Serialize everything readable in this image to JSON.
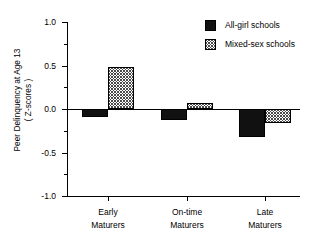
{
  "chart_data": {
    "type": "bar",
    "title": "",
    "xlabel": "",
    "ylabel": "Peer Delinquency at Age 13",
    "ylabel_line2": "( Z-scores )",
    "categories": [
      "Early\nMaturers",
      "On-time\nMaturers",
      "Late\nMaturers"
    ],
    "category_labels": [
      {
        "line1": "Early",
        "line2": "Maturers"
      },
      {
        "line1": "On-time",
        "line2": "Maturers"
      },
      {
        "line1": "Late",
        "line2": "Maturers"
      }
    ],
    "series": [
      {
        "name": "All-girl schools",
        "fill": "solid-black",
        "color": "#111111",
        "values": [
          -0.09,
          -0.13,
          -0.32
        ]
      },
      {
        "name": "Mixed-sex schools",
        "fill": "crosshatch-gray",
        "color": "#4a4a4a",
        "values": [
          0.48,
          0.07,
          -0.16
        ]
      }
    ],
    "ylim": [
      -1.0,
      1.0
    ],
    "ytick_values": [
      1.0,
      0.5,
      0.0,
      -0.5,
      -1.0
    ],
    "ytick_labels": [
      "1.0",
      "0.5",
      "0.0",
      "-0.5",
      "-1.0"
    ],
    "yminor_tick_values": [
      0.75,
      0.25,
      -0.25,
      -0.75
    ],
    "grid": false,
    "legend_position": "top-right",
    "zero_line": true
  },
  "legend": {
    "entries": [
      {
        "label": "All-girl schools",
        "swatch": "solid"
      },
      {
        "label": "Mixed-sex schools",
        "swatch": "hatch"
      }
    ]
  },
  "axis": {
    "y_title_line1": "Peer Delinquency at Age 13",
    "y_title_line2": "( Z-scores )",
    "y_labels": [
      "1.0",
      "0.5",
      "0.0",
      "-0.5",
      "-1.0"
    ]
  }
}
